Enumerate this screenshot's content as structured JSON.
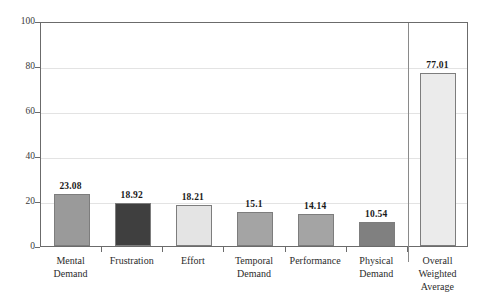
{
  "chart_data": {
    "type": "bar",
    "title": "",
    "subtitle": "",
    "xlabel": "",
    "ylabel": "",
    "ylim": [
      0,
      100
    ],
    "yticks": [
      0,
      20,
      40,
      60,
      80,
      100
    ],
    "grid": true,
    "legend": "none",
    "categories": [
      "Mental Demand",
      "Frustration",
      "Effort",
      "Temporal Demand",
      "Performance",
      "Physical Demand",
      "Overall Weighted Average"
    ],
    "category_lines": [
      [
        "Mental",
        "Demand"
      ],
      [
        "Frustration"
      ],
      [
        "Effort"
      ],
      [
        "Temporal",
        "Demand"
      ],
      [
        "Performance"
      ],
      [
        "Physical",
        "Demand"
      ],
      [
        "Overall",
        "Weighted",
        "Average"
      ]
    ],
    "values": [
      23.08,
      18.92,
      18.21,
      15.1,
      14.14,
      10.54,
      77.01
    ],
    "value_labels": [
      "23.08",
      "18.92",
      "18.21",
      "15.1",
      "14.14",
      "10.54",
      "77.01"
    ],
    "bar_colors": [
      "#9a9a9a",
      "#3f3f3f",
      "#e4e4e4",
      "#a4a4a4",
      "#a4a4a4",
      "#808080",
      "#ebebeb"
    ],
    "bar_border_color": "#7d7d7d",
    "separator_after_index": 5,
    "axis_color": "#6b6b6b",
    "gridline_color": "#e3e3e3",
    "background_color": "#ffffff"
  }
}
